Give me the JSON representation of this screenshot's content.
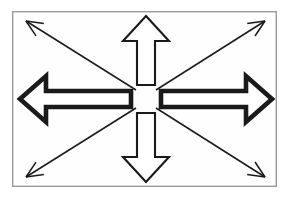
{
  "figure": {
    "canvas": {
      "width": 288,
      "height": 198,
      "background": "#ffffff"
    },
    "frame": {
      "name": "border-frame",
      "x": 12,
      "y": 11,
      "width": 265,
      "height": 176,
      "stroke": "#9a9a9a",
      "stroke_width": 1.4,
      "fill": "#fefefe"
    },
    "center": {
      "x": 146,
      "y": 99,
      "gap_radius": 14
    },
    "colors": {
      "outline": "#1a1a1a",
      "fill": "#ffffff",
      "frame": "#9a9a9a",
      "background": "#ffffff"
    },
    "arrows": [
      {
        "id": "arrow-left",
        "label": "Left arrow",
        "direction": "west",
        "style": "thick-outlined",
        "stroke_width": 4.6,
        "tip": {
          "x": 20,
          "y": 99
        },
        "tail": {
          "x": 131,
          "y": 99
        },
        "head_length": 26,
        "head_half_width": 23,
        "shaft_half_width": 8,
        "outline": "#1a1a1a",
        "fill": "#ffffff"
      },
      {
        "id": "arrow-right",
        "label": "Right arrow",
        "direction": "east",
        "style": "thick-outlined",
        "stroke_width": 4.6,
        "tip": {
          "x": 272,
          "y": 99
        },
        "tail": {
          "x": 161,
          "y": 99
        },
        "head_length": 26,
        "head_half_width": 23,
        "shaft_half_width": 8,
        "outline": "#1a1a1a",
        "fill": "#ffffff"
      },
      {
        "id": "arrow-up",
        "label": "Up arrow",
        "direction": "north",
        "style": "medium-outlined",
        "stroke_width": 2.1,
        "tip": {
          "x": 146,
          "y": 16
        },
        "tail": {
          "x": 146,
          "y": 85
        },
        "head_length": 25,
        "head_half_width": 23,
        "shaft_half_width": 9,
        "outline": "#1a1a1a",
        "fill": "#ffffff"
      },
      {
        "id": "arrow-down",
        "label": "Down arrow",
        "direction": "south",
        "style": "medium-outlined",
        "stroke_width": 2.1,
        "tip": {
          "x": 146,
          "y": 182
        },
        "tail": {
          "x": 146,
          "y": 113
        },
        "head_length": 25,
        "head_half_width": 23,
        "shaft_half_width": 9,
        "outline": "#1a1a1a",
        "fill": "#ffffff"
      },
      {
        "id": "arrow-up-left",
        "label": "Up-left diagonal arrow",
        "direction": "northwest",
        "style": "thin-line-barbed",
        "stroke_width": 1.5,
        "tip": {
          "x": 26,
          "y": 21
        },
        "tail": {
          "x": 136,
          "y": 90
        },
        "barb_length": 18,
        "outline": "#1a1a1a"
      },
      {
        "id": "arrow-up-right",
        "label": "Up-right diagonal arrow",
        "direction": "northeast",
        "style": "thin-line-barbed",
        "stroke_width": 1.5,
        "tip": {
          "x": 265,
          "y": 21
        },
        "tail": {
          "x": 156,
          "y": 90
        },
        "barb_length": 18,
        "outline": "#1a1a1a"
      },
      {
        "id": "arrow-down-left",
        "label": "Down-left diagonal arrow",
        "direction": "southwest",
        "style": "thin-line-barbed",
        "stroke_width": 1.5,
        "tip": {
          "x": 26,
          "y": 177
        },
        "tail": {
          "x": 136,
          "y": 108
        },
        "barb_length": 18,
        "outline": "#1a1a1a"
      },
      {
        "id": "arrow-down-right",
        "label": "Down-right diagonal arrow",
        "direction": "southeast",
        "style": "thin-line-barbed",
        "stroke_width": 1.5,
        "tip": {
          "x": 265,
          "y": 177
        },
        "tail": {
          "x": 156,
          "y": 108
        },
        "barb_length": 18,
        "outline": "#1a1a1a"
      }
    ]
  }
}
